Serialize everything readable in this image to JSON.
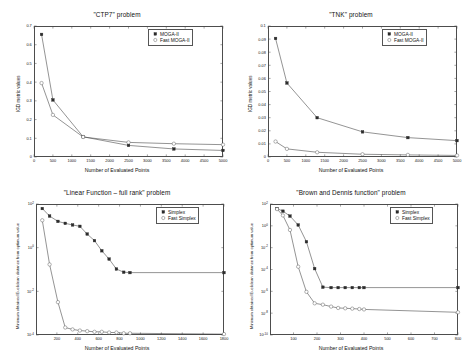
{
  "figure": {
    "panel_count": 4,
    "background": "#ffffff",
    "axis_color": "#4d4d4d",
    "series_colors": {
      "filled": "#2b2b2b",
      "open": "#555555"
    }
  },
  "chart_data": [
    {
      "id": "ctp7",
      "type": "line",
      "title": "\"CTP7\" problem",
      "xlabel": "Number of Evaluated Points",
      "ylabel": "IGD metric values",
      "xscale": "linear",
      "yscale": "linear",
      "xlim": [
        0,
        5000
      ],
      "ylim": [
        0,
        0.7
      ],
      "grid": false,
      "legend_position": "top-right",
      "xticks": [
        0,
        500,
        1000,
        1500,
        2000,
        2500,
        3000,
        3500,
        4000,
        4500,
        5000
      ],
      "xticklabels": [
        "0",
        "500",
        "1000",
        "1500",
        "2000",
        "2500",
        "3000",
        "3500",
        "4000",
        "4500",
        "5000"
      ],
      "yticks": [
        0,
        0.1,
        0.2,
        0.3,
        0.4,
        0.5,
        0.6,
        0.7
      ],
      "yticklabels": [
        "0",
        "0.1",
        "0.2",
        "0.3",
        "0.4",
        "0.5",
        "0.6",
        "0.7"
      ],
      "series": [
        {
          "name": "MOGA-II",
          "marker": "filled-square",
          "x": [
            200,
            500,
            1300,
            2500,
            3700,
            5000
          ],
          "values": [
            0.655,
            0.305,
            0.108,
            0.062,
            0.043,
            0.035
          ]
        },
        {
          "name": "Fast MOGA-II",
          "marker": "open-circle",
          "x": [
            200,
            500,
            1300,
            2500,
            3700,
            5000
          ],
          "values": [
            0.395,
            0.225,
            0.107,
            0.078,
            0.071,
            0.066
          ]
        }
      ]
    },
    {
      "id": "tnk",
      "type": "line",
      "title": "\"TNK\" problem",
      "xlabel": "Number of Evaluated Points",
      "ylabel": "IGD metric values",
      "xscale": "linear",
      "yscale": "linear",
      "xlim": [
        0,
        5000
      ],
      "ylim": [
        0,
        0.1
      ],
      "grid": false,
      "legend_position": "top-right",
      "xticks": [
        0,
        500,
        1000,
        1500,
        2000,
        2500,
        3000,
        3500,
        4000,
        4500,
        5000
      ],
      "xticklabels": [
        "0",
        "500",
        "1000",
        "1500",
        "2000",
        "2500",
        "3000",
        "3500",
        "4000",
        "4500",
        "5000"
      ],
      "yticks": [
        0,
        0.01,
        0.02,
        0.03,
        0.04,
        0.05,
        0.06,
        0.07,
        0.08,
        0.09,
        0.1
      ],
      "yticklabels": [
        "0",
        "0.01",
        "0.02",
        "0.03",
        "0.04",
        "0.05",
        "0.06",
        "0.07",
        "0.08",
        "0.09",
        "0.1"
      ],
      "series": [
        {
          "name": "MOGA-II",
          "marker": "filled-square",
          "x": [
            200,
            500,
            1300,
            2500,
            3700,
            5000
          ],
          "values": [
            0.0905,
            0.0565,
            0.03,
            0.0192,
            0.0148,
            0.0125
          ]
        },
        {
          "name": "Fast MOGA-II",
          "marker": "open-circle",
          "x": [
            200,
            500,
            1300,
            2500,
            3700,
            5000
          ],
          "values": [
            0.0118,
            0.0062,
            0.0036,
            0.0021,
            0.0016,
            0.0012
          ]
        }
      ]
    },
    {
      "id": "linear-full-rank",
      "type": "line",
      "title": "\"Linear Function – full rank\" problem",
      "xlabel": "Number of Evaluated Points",
      "ylabel": "Minimum obtained Euclidean distance from optimum value",
      "xscale": "linear",
      "yscale": "log",
      "xlim": [
        0,
        1800
      ],
      "ylim": [
        0.0001,
        100
      ],
      "grid": false,
      "legend_position": "top-right",
      "xticks": [
        200,
        400,
        600,
        800,
        1000,
        1200,
        1400,
        1600,
        1800
      ],
      "xticklabels": [
        "200",
        "400",
        "600",
        "800",
        "1000",
        "1200",
        "1400",
        "1600",
        "1800"
      ],
      "yticks": [
        0.0001,
        0.01,
        1,
        100
      ],
      "yticklabels": [
        "10^-4",
        "10^-2",
        "10^0",
        "10^2"
      ],
      "series": [
        {
          "name": "Simplex",
          "marker": "filled-square",
          "x": [
            60,
            130,
            210,
            280,
            350,
            420,
            490,
            560,
            630,
            700,
            770,
            840,
            900,
            1800
          ],
          "values": [
            62,
            28,
            16,
            13,
            11,
            9.5,
            4.2,
            2.1,
            0.72,
            0.3,
            0.105,
            0.075,
            0.072,
            0.072
          ]
        },
        {
          "name": "Fast Simplex",
          "marker": "open-circle",
          "x": [
            60,
            130,
            210,
            280,
            350,
            420,
            490,
            560,
            630,
            700,
            770,
            840,
            900,
            1800
          ],
          "values": [
            18,
            0.17,
            0.0032,
            0.00022,
            0.00018,
            0.00016,
            0.00015,
            0.00014,
            0.00014,
            0.00013,
            0.00013,
            0.00012,
            0.00012,
            0.00011
          ]
        }
      ]
    },
    {
      "id": "brown-and-dennis",
      "type": "line",
      "title": "\"Brown and Dennis function\" problem",
      "xlabel": "Number of Evaluated Points",
      "ylabel": "Minimum obtained Euclidean distance from optimum value",
      "xscale": "linear",
      "yscale": "log",
      "xlim": [
        0,
        800
      ],
      "ylim": [
        1e-10,
        100
      ],
      "grid": false,
      "legend_position": "top-right",
      "xticks": [
        100,
        200,
        300,
        400,
        500,
        600,
        700,
        800
      ],
      "xticklabels": [
        "100",
        "200",
        "300",
        "400",
        "500",
        "600",
        "700",
        "800"
      ],
      "yticks": [
        1e-10,
        1e-08,
        1e-06,
        0.0001,
        0.01,
        1,
        100
      ],
      "yticklabels": [
        "10^-10",
        "10^-8",
        "10^-6",
        "10^-4",
        "10^-2",
        "10^0",
        "10^2"
      ],
      "series": [
        {
          "name": "Simplex",
          "marker": "filled-square",
          "x": [
            30,
            55,
            85,
            120,
            155,
            190,
            225,
            260,
            290,
            320,
            350,
            380,
            400,
            800
          ],
          "values": [
            38,
            22,
            7.8,
            1.2,
            0.035,
            0.00012,
            2.4e-06,
            2.2e-06,
            2.2e-06,
            2.2e-06,
            2.2e-06,
            2.2e-06,
            2.2e-06,
            2.2e-06
          ]
        },
        {
          "name": "Fast Simplex",
          "marker": "open-circle",
          "x": [
            30,
            55,
            85,
            120,
            155,
            190,
            225,
            260,
            290,
            320,
            350,
            380,
            400,
            800
          ],
          "values": [
            34,
            9.0,
            0.42,
            0.00018,
            9e-07,
            8e-08,
            6e-08,
            4e-08,
            3e-08,
            2.8e-08,
            2.6e-08,
            2.4e-08,
            2.2e-08,
            1.2e-08
          ]
        }
      ]
    }
  ]
}
